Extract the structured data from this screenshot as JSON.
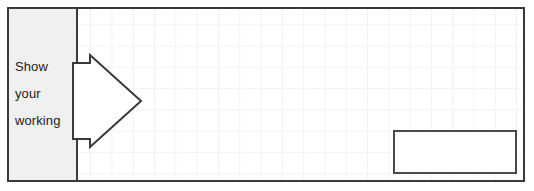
{
  "worksheet": {
    "question_panel": {
      "name": "show-your-working-question",
      "border_color": "#3a3a3a",
      "background_color": "#ffffff"
    },
    "prompt": {
      "panel_background": "#f0f0f0",
      "text_color": "#1b1b1b",
      "lines": [
        "Show",
        "your",
        "working"
      ],
      "full_text": "Show your working"
    },
    "arrow": {
      "icon": "right-block-arrow-icon",
      "direction": "right",
      "fill": "#ffffff",
      "stroke": "#3a3a3a"
    },
    "answer_box": {
      "value": "",
      "placeholder": "",
      "border_color": "#4a4a4a",
      "background_color": "#ffffff"
    },
    "grid": {
      "line_color": "#f2f2f3",
      "cell_size_px": "21.3"
    }
  }
}
